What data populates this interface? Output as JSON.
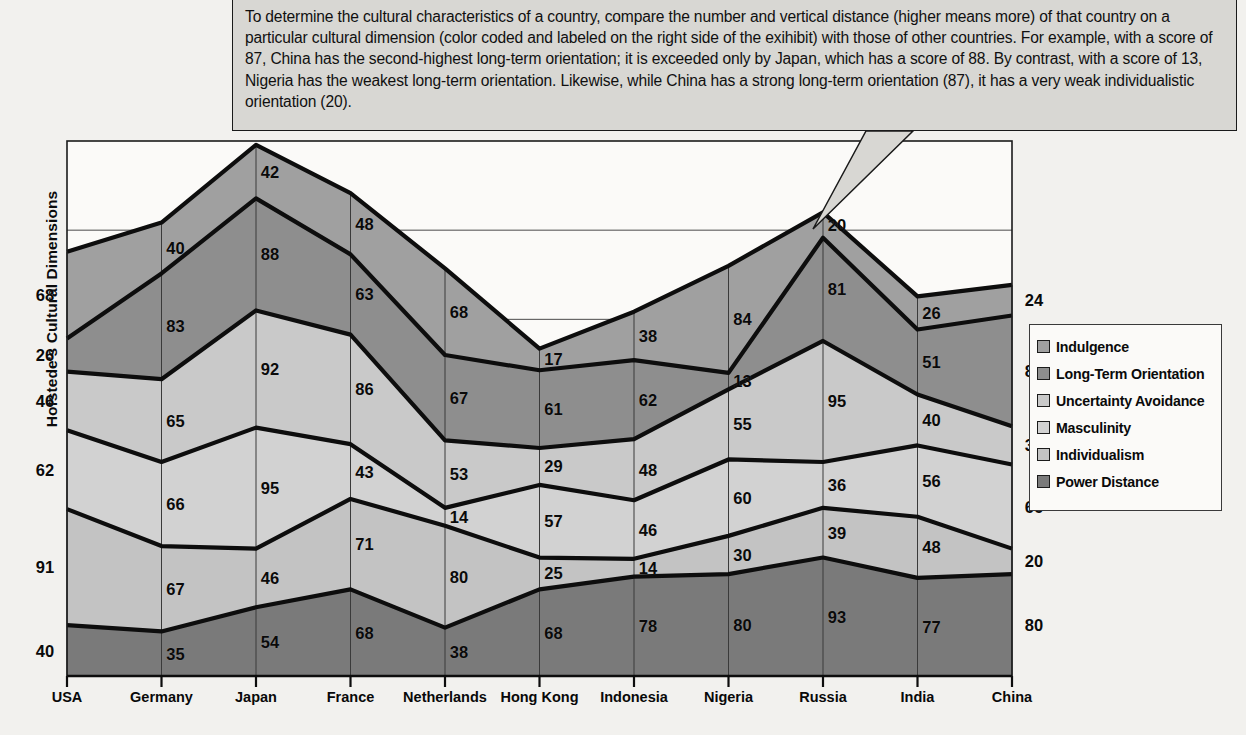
{
  "chart_data": {
    "type": "area",
    "title": "",
    "ylabel": "Hofstede's Cultural Dimensions",
    "xlabel": "",
    "grid": true,
    "legend_position": "right",
    "ylim": [
      0,
      420
    ],
    "categories": [
      "USA",
      "Germany",
      "Japan",
      "France",
      "Netherlands",
      "Hong Kong",
      "Indonesia",
      "Nigeria",
      "Russia",
      "India",
      "China"
    ],
    "series": [
      {
        "name": "Power Distance",
        "color": "#7a7a7a",
        "values": [
          40,
          35,
          54,
          68,
          38,
          68,
          78,
          80,
          93,
          77,
          80
        ]
      },
      {
        "name": "Individualism",
        "color": "#c3c3c3",
        "values": [
          91,
          67,
          46,
          71,
          80,
          25,
          14,
          30,
          39,
          48,
          20
        ]
      },
      {
        "name": "Masculinity",
        "color": "#d2d2d2",
        "values": [
          62,
          66,
          95,
          43,
          14,
          57,
          46,
          60,
          36,
          56,
          66
        ]
      },
      {
        "name": "Uncertainty Avoidance",
        "color": "#c9c9c9",
        "values": [
          46,
          65,
          92,
          86,
          53,
          29,
          48,
          55,
          95,
          40,
          30
        ]
      },
      {
        "name": "Long-Term Orientation",
        "color": "#8e8e8e",
        "values": [
          26,
          83,
          88,
          63,
          67,
          61,
          62,
          13,
          81,
          51,
          87
        ]
      },
      {
        "name": "Indulgence",
        "color": "#a0a0a0",
        "values": [
          68,
          40,
          42,
          48,
          68,
          17,
          38,
          84,
          20,
          26,
          24
        ]
      }
    ]
  },
  "legend": {
    "items": [
      {
        "label": "Indulgence",
        "color": "#a0a0a0"
      },
      {
        "label": "Long-Term Orientation",
        "color": "#8e8e8e"
      },
      {
        "label": "Uncertainty Avoidance",
        "color": "#c9c9c9"
      },
      {
        "label": "Masculinity",
        "color": "#d2d2d2"
      },
      {
        "label": "Individualism",
        "color": "#c3c3c3"
      },
      {
        "label": "Power Distance",
        "color": "#7a7a7a"
      }
    ]
  },
  "callout": {
    "text": "To determine the cultural characteristics of a country, compare the number and vertical distance (higher means more) of that country on a particular cultural dimension (color coded and labeled on the right side of the exihibit) with those of other countries. For example, with a score of 87, China has the second-highest long-term orientation; it is exceeded only by Japan, which has a score of 88. By contrast, with a score of 13, Nigeria has the weakest long-term orientation. Likewise, while China has a strong long-term orientation (87), it has a very weak individualistic orientation (20)."
  },
  "axes": {
    "y_title": "Hofstede's Cultural Dimensions"
  }
}
